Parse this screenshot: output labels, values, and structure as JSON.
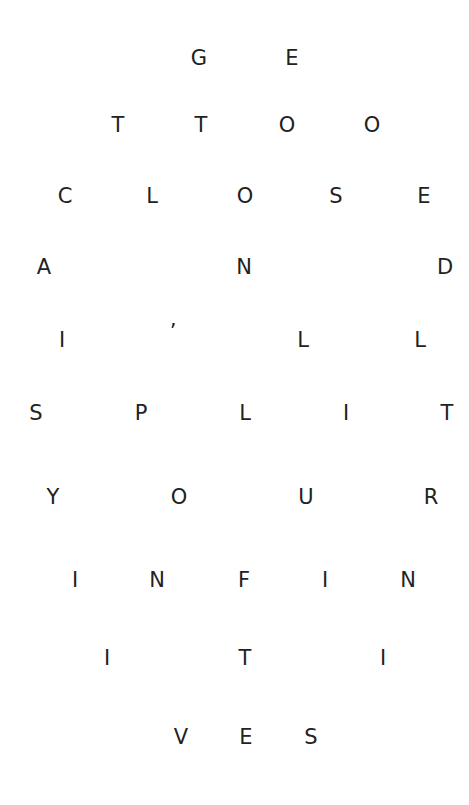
{
  "poem": {
    "text": "GET TOO CLOSE AND I'LL SPLIT YOUR INFINITIVES",
    "color": "#222222",
    "rows": [
      {
        "y": 58,
        "letters": [
          {
            "ch": "G",
            "x": 199
          },
          {
            "ch": "E",
            "x": 292
          }
        ]
      },
      {
        "y": 125,
        "letters": [
          {
            "ch": "T",
            "x": 118
          },
          {
            "ch": "T",
            "x": 201
          },
          {
            "ch": "O",
            "x": 287
          },
          {
            "ch": "O",
            "x": 372
          }
        ]
      },
      {
        "y": 196,
        "letters": [
          {
            "ch": "C",
            "x": 65
          },
          {
            "ch": "L",
            "x": 152
          },
          {
            "ch": "O",
            "x": 245
          },
          {
            "ch": "S",
            "x": 336
          },
          {
            "ch": "E",
            "x": 424
          }
        ]
      },
      {
        "y": 267,
        "letters": [
          {
            "ch": "A",
            "x": 44
          },
          {
            "ch": "N",
            "x": 244
          },
          {
            "ch": "D",
            "x": 445
          }
        ]
      },
      {
        "y": 340,
        "letters": [
          {
            "ch": "I",
            "x": 62
          },
          {
            "ch": "’",
            "x": 173,
            "dy": -8
          },
          {
            "ch": "L",
            "x": 303
          },
          {
            "ch": "L",
            "x": 420
          }
        ]
      },
      {
        "y": 413,
        "letters": [
          {
            "ch": "S",
            "x": 36
          },
          {
            "ch": "P",
            "x": 141
          },
          {
            "ch": "L",
            "x": 245
          },
          {
            "ch": "I",
            "x": 346
          },
          {
            "ch": "T",
            "x": 447
          }
        ]
      },
      {
        "y": 497,
        "letters": [
          {
            "ch": "Y",
            "x": 53
          },
          {
            "ch": "O",
            "x": 179
          },
          {
            "ch": "U",
            "x": 306
          },
          {
            "ch": "R",
            "x": 431
          }
        ]
      },
      {
        "y": 580,
        "letters": [
          {
            "ch": "I",
            "x": 75
          },
          {
            "ch": "N",
            "x": 157
          },
          {
            "ch": "F",
            "x": 244
          },
          {
            "ch": "I",
            "x": 325
          },
          {
            "ch": "N",
            "x": 408
          }
        ]
      },
      {
        "y": 658,
        "letters": [
          {
            "ch": "I",
            "x": 107
          },
          {
            "ch": "T",
            "x": 245
          },
          {
            "ch": "I",
            "x": 383
          }
        ]
      },
      {
        "y": 737,
        "letters": [
          {
            "ch": "V",
            "x": 181
          },
          {
            "ch": "E",
            "x": 246
          },
          {
            "ch": "S",
            "x": 311
          }
        ]
      }
    ]
  }
}
